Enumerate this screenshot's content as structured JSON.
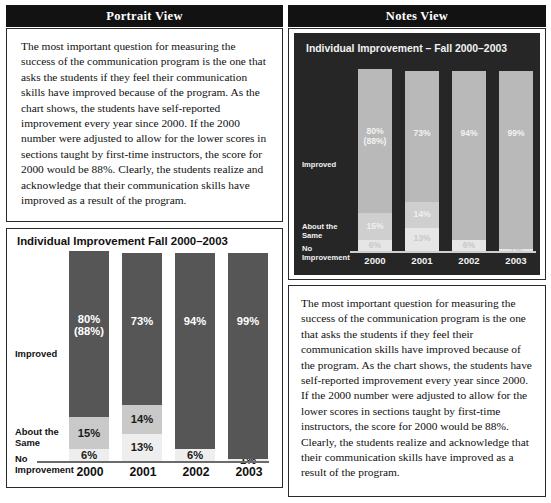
{
  "headers": {
    "left": "Portrait View",
    "right": "Notes View"
  },
  "body_text": "The most important question for measuring the success of the communication program is the one that asks the students if they feel their communication skills have improved because of the program. As the chart shows, the students have self-reported improvement every year since 2000. If the 2000 number were adjusted to allow for the lower scores in sections taught by first-time instructors, the score for 2000 would be 88%. Clearly, the students realize and acknowledge that their communication skills have improved as a result of the program.",
  "colors": {
    "header_bg": "#121212",
    "header_text": "#ffffff",
    "page_bg": "#ffffff",
    "border": "#2b2b2b",
    "portrait_improved": "#565656",
    "portrait_same": "#c9c9c9",
    "portrait_none": "#eeeeee",
    "notes_panel_bg": "#262626",
    "notes_improved": "#b9b9b9",
    "notes_same": "#cfcfcf",
    "notes_none": "#e6e6e6"
  },
  "chart_data": [
    {
      "id": "portrait-chart",
      "type": "bar",
      "stacked": true,
      "title": "Individual Improvement Fall 2000–2003",
      "xlabel": "",
      "ylabel": "",
      "ylim": [
        0,
        100
      ],
      "grid": false,
      "legend_position": "left-axis-labels",
      "categories": [
        "2000",
        "2001",
        "2002",
        "2003"
      ],
      "category_labels": [
        {
          "line1": "Improved",
          "line2": ""
        },
        {
          "line1": "About the",
          "line2": "Same"
        },
        {
          "line1": "No",
          "line2": "Improvement"
        }
      ],
      "series": [
        {
          "name": "Improved",
          "values": [
            80,
            73,
            94,
            99
          ],
          "labels": [
            "80%",
            "73%",
            "94%",
            "99%"
          ],
          "sublabels": [
            "(88%)",
            "",
            "",
            ""
          ]
        },
        {
          "name": "About the Same",
          "values": [
            15,
            14,
            0,
            0
          ],
          "labels": [
            "15%",
            "14%",
            "",
            ""
          ],
          "sublabels": [
            "",
            "",
            "",
            ""
          ]
        },
        {
          "name": "No Improvement",
          "values": [
            6,
            13,
            6,
            1
          ],
          "labels": [
            "6%",
            "13%",
            "6%",
            "1%"
          ],
          "sublabels": [
            "",
            "",
            "",
            ""
          ]
        }
      ]
    },
    {
      "id": "notes-chart",
      "type": "bar",
      "stacked": true,
      "title": "Individual Improvement – Fall 2000–2003",
      "xlabel": "",
      "ylabel": "",
      "ylim": [
        0,
        100
      ],
      "grid": false,
      "legend_position": "left-axis-labels",
      "categories": [
        "2000",
        "2001",
        "2002",
        "2003"
      ],
      "category_labels": [
        {
          "line1": "Improved",
          "line2": ""
        },
        {
          "line1": "About the",
          "line2": "Same"
        },
        {
          "line1": "No",
          "line2": "Improvement"
        }
      ],
      "series": [
        {
          "name": "Improved",
          "values": [
            80,
            73,
            94,
            99
          ],
          "labels": [
            "80%",
            "73%",
            "94%",
            "99%"
          ],
          "sublabels": [
            "(88%)",
            "",
            "",
            ""
          ]
        },
        {
          "name": "About the Same",
          "values": [
            15,
            14,
            0,
            0
          ],
          "labels": [
            "15%",
            "14%",
            "",
            ""
          ],
          "sublabels": [
            "",
            "",
            "",
            ""
          ]
        },
        {
          "name": "No Improvement",
          "values": [
            6,
            13,
            6,
            1
          ],
          "labels": [
            "6%",
            "13%",
            "6%",
            "1%"
          ],
          "sublabels": [
            "",
            "",
            "",
            ""
          ]
        }
      ]
    }
  ]
}
